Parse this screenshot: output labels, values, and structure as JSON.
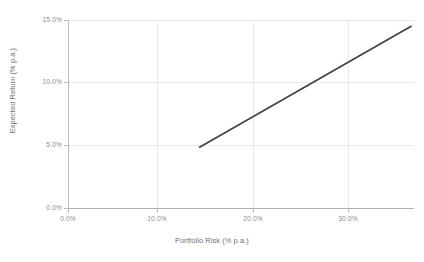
{
  "chart_data": {
    "type": "line",
    "title": "",
    "xlabel": "Portfolio Risk (% p.a.)",
    "ylabel": "Expected Return (% p.a.)",
    "xlim": [
      0.0,
      36.3
    ],
    "ylim": [
      0.0,
      15.0
    ],
    "xticks": [
      0.0,
      10.0,
      20.0,
      30.0
    ],
    "xtick_labels": [
      "0.0%",
      "10.0%",
      "20.0%",
      "30.0%"
    ],
    "yticks": [
      0.0,
      5.0,
      10.0,
      15.0
    ],
    "ytick_labels": [
      "0.0%",
      "5.0%",
      "10.0%",
      "15.0%"
    ],
    "grid": true,
    "legend": "none",
    "series": [
      {
        "name": "Capital Market Line",
        "color": "#3f3f4a",
        "line_width": 1.6,
        "x": [
          13.8,
          36.0
        ],
        "y": [
          4.85,
          14.5
        ],
        "points": [
          {
            "x": 13.8,
            "y": 4.85
          },
          {
            "x": 36.0,
            "y": 14.5
          }
        ]
      }
    ]
  },
  "axes": {
    "x_tick_labels": [
      "0.0%",
      "10.0%",
      "20.0%",
      "30.0%"
    ],
    "y_tick_labels": [
      "15.0%",
      "10.0%",
      "5.0%",
      "0.0%"
    ],
    "x_title": "Portfolio Risk (% p.a.)",
    "y_title": "Expected Return (% p.a.)"
  },
  "colors": {
    "line": "#3f3f4a",
    "grid": "#e9e9e9",
    "axis": "#b3b3b3",
    "tick_text": "#8d8d8d",
    "title_text": "#6f6f6f",
    "background": "#ffffff"
  }
}
